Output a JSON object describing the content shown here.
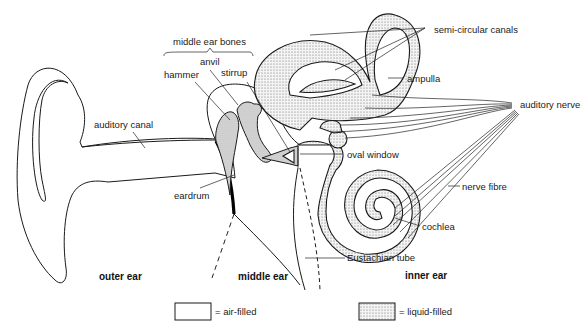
{
  "labels": {
    "middle_ear_bones": "middle ear bones",
    "anvil": "anvil",
    "hammer": "hammer",
    "stirrup": "stirrup",
    "auditory_canal": "auditory canal",
    "eardrum": "eardrum",
    "semi_circular_canals": "semi-circular canals",
    "ampulla": "ampulla",
    "auditory_nerve": "auditory nerve",
    "oval_window": "oval window",
    "nerve_fibre": "nerve fibre",
    "cochlea": "cochlea",
    "eustachian_tube": "Eustachian tube"
  },
  "regions": {
    "outer_ear": "outer ear",
    "middle_ear": "middle ear",
    "inner_ear": "inner ear"
  },
  "legend": [
    {
      "key": "air",
      "label": "= air-filled"
    },
    {
      "key": "liquid",
      "label": "= liquid-filled"
    }
  ],
  "colors": {
    "line": "#1a1a1a",
    "liquid_dots": "#666666",
    "bone_fill": "#d8d8d8",
    "background": "#ffffff"
  }
}
